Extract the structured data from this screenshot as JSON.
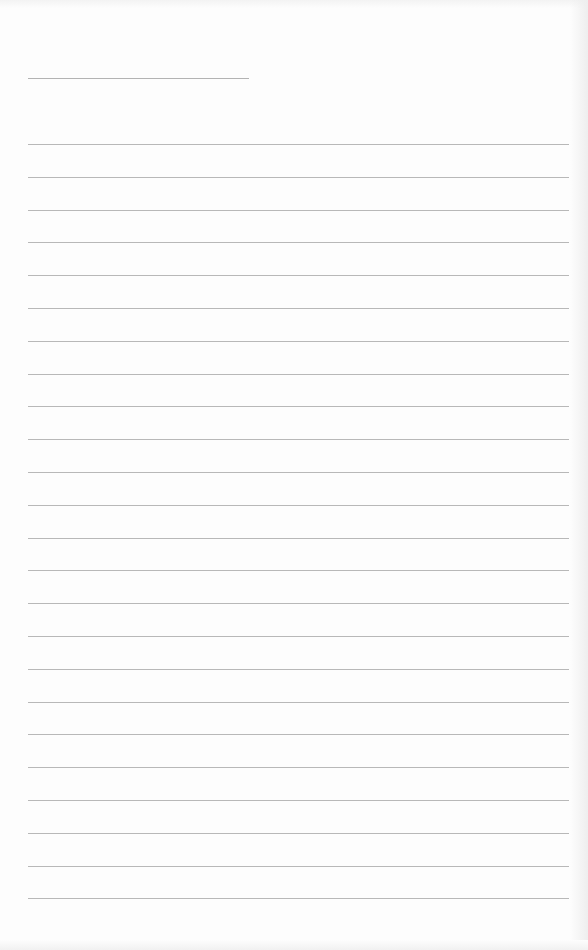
{
  "page": {
    "type": "lined-paper",
    "background": "#fdfdfd",
    "line_color": "#b8b8b8",
    "header_line": {
      "x": 28,
      "y": 78,
      "width": 221
    },
    "rules": {
      "count": 24,
      "start_y": 144,
      "spacing": 32.8,
      "x": 28,
      "width": 541
    }
  }
}
